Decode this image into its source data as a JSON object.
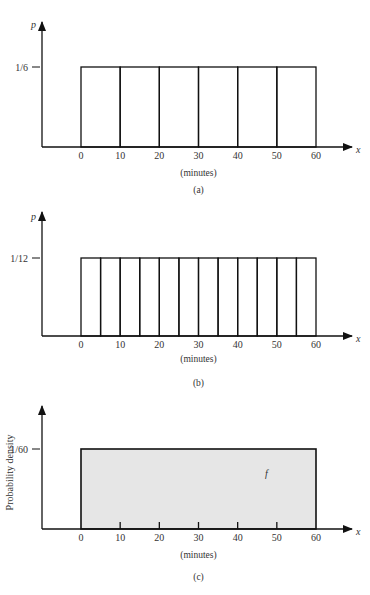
{
  "chart_data": [
    {
      "type": "bar",
      "panel_label": "(a)",
      "description": "Discrete uniform distribution over six 10-minute intervals",
      "ylabel": "p",
      "xlabel": "x",
      "x_unit_label": "(minutes)",
      "x_ticks": [
        "0",
        "10",
        "20",
        "30",
        "40",
        "50",
        "60"
      ],
      "xlim": [
        0,
        60
      ],
      "bin_edges": [
        0,
        10,
        20,
        30,
        40,
        50,
        60
      ],
      "values": [
        0.1667,
        0.1667,
        0.1667,
        0.1667,
        0.1667,
        0.1667
      ],
      "y_level_label": "1/6",
      "y_level_value": 0.1667,
      "filled": false,
      "grid": false
    },
    {
      "type": "bar",
      "panel_label": "(b)",
      "description": "Discrete uniform distribution over twelve 5-minute intervals",
      "ylabel": "p",
      "xlabel": "x",
      "x_unit_label": "(minutes)",
      "x_ticks": [
        "0",
        "10",
        "20",
        "30",
        "40",
        "50",
        "60"
      ],
      "xlim": [
        0,
        60
      ],
      "bin_edges": [
        0,
        5,
        10,
        15,
        20,
        25,
        30,
        35,
        40,
        45,
        50,
        55,
        60
      ],
      "values": [
        0.0833,
        0.0833,
        0.0833,
        0.0833,
        0.0833,
        0.0833,
        0.0833,
        0.0833,
        0.0833,
        0.0833,
        0.0833,
        0.0833
      ],
      "y_level_label": "1/12",
      "y_level_value": 0.0833,
      "filled": false,
      "grid": false
    },
    {
      "type": "area",
      "panel_label": "(c)",
      "description": "Continuous uniform probability density over 0-60 minutes",
      "ylabel": "Probability density",
      "xlabel": "x",
      "x_unit_label": "(minutes)",
      "x_ticks": [
        "0",
        "10",
        "20",
        "30",
        "40",
        "50",
        "60"
      ],
      "xlim": [
        0,
        60
      ],
      "bin_edges": [
        0,
        60
      ],
      "values": [
        0.01667
      ],
      "y_level_label": "1/60",
      "y_level_value": 0.01667,
      "filled": true,
      "fill_color": "#e6e6e6",
      "annotation": "f",
      "grid": false
    }
  ]
}
